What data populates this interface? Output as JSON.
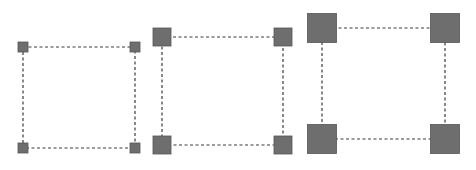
{
  "diagram": {
    "handle_color": "#6e6e6e",
    "handle_border": "#555555",
    "line_color": "#3a3a3a",
    "panels": [
      {
        "name": "small-handles",
        "x1": 23,
        "y1": 47,
        "x2": 135,
        "y2": 148,
        "handle_size": 10
      },
      {
        "name": "medium-handles",
        "x1": 162,
        "y1": 37,
        "x2": 283,
        "y2": 145,
        "handle_size": 18
      },
      {
        "name": "large-handles",
        "x1": 322,
        "y1": 28,
        "x2": 445,
        "y2": 139,
        "handle_size": 29
      }
    ]
  }
}
